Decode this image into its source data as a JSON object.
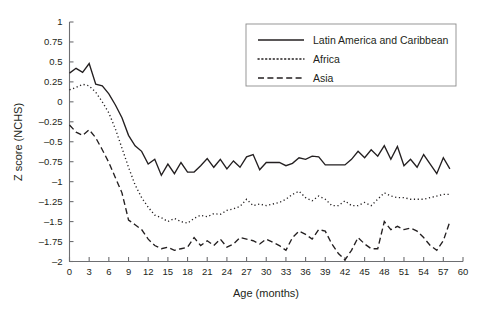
{
  "chart_data": {
    "type": "line",
    "title": "",
    "xlabel": "Age (months)",
    "ylabel": "Z score (NCHS)",
    "xlim": [
      0,
      60
    ],
    "ylim": [
      -2,
      1
    ],
    "xticks": [
      0,
      3,
      6,
      9,
      12,
      15,
      18,
      21,
      24,
      27,
      30,
      33,
      36,
      39,
      42,
      45,
      48,
      51,
      54,
      57,
      60
    ],
    "xtick_labels": [
      "0",
      "3",
      "6",
      "9",
      "12",
      "15",
      "18",
      "21",
      "24",
      "27",
      "30",
      "33",
      "36",
      "39",
      "42",
      "45",
      "48",
      "51",
      "54",
      "57",
      "60"
    ],
    "yticks": [
      1,
      0.75,
      0.5,
      0.25,
      0,
      -0.25,
      -0.5,
      -0.75,
      -1,
      -1.25,
      -1.5,
      -1.75,
      -2
    ],
    "ytick_labels": [
      "1",
      "0.75",
      "0.5",
      "0.25",
      "0",
      "–0.25",
      "–0.5",
      "–0.75",
      "–1",
      "–1.25",
      "–1.5",
      "–1.75",
      "–2"
    ],
    "grid": false,
    "legend_position": "top-right",
    "x": [
      0,
      1,
      2,
      3,
      4,
      5,
      6,
      7,
      8,
      9,
      10,
      11,
      12,
      13,
      14,
      15,
      16,
      17,
      18,
      19,
      20,
      21,
      22,
      23,
      24,
      25,
      26,
      27,
      28,
      29,
      30,
      31,
      32,
      33,
      34,
      35,
      36,
      37,
      38,
      39,
      40,
      41,
      42,
      43,
      44,
      45,
      46,
      47,
      48,
      49,
      50,
      51,
      52,
      53,
      54,
      55,
      56,
      57,
      58
    ],
    "series": [
      {
        "name": "Latin America and Caribbean",
        "style": "solid",
        "values": [
          0.36,
          0.42,
          0.37,
          0.48,
          0.22,
          0.2,
          0.1,
          -0.04,
          -0.2,
          -0.42,
          -0.55,
          -0.62,
          -0.78,
          -0.72,
          -0.92,
          -0.78,
          -0.9,
          -0.76,
          -0.88,
          -0.88,
          -0.8,
          -0.71,
          -0.82,
          -0.72,
          -0.84,
          -0.74,
          -0.82,
          -0.69,
          -0.66,
          -0.85,
          -0.76,
          -0.76,
          -0.76,
          -0.8,
          -0.77,
          -0.7,
          -0.72,
          -0.68,
          -0.69,
          -0.79,
          -0.79,
          -0.79,
          -0.79,
          -0.72,
          -0.62,
          -0.7,
          -0.6,
          -0.68,
          -0.55,
          -0.72,
          -0.56,
          -0.8,
          -0.72,
          -0.82,
          -0.66,
          -0.78,
          -0.9,
          -0.7,
          -0.84
        ]
      },
      {
        "name": "Africa",
        "style": "dotted",
        "values": [
          0.15,
          0.18,
          0.22,
          0.2,
          0.12,
          0.0,
          -0.14,
          -0.34,
          -0.58,
          -0.82,
          -1.04,
          -1.2,
          -1.32,
          -1.42,
          -1.45,
          -1.5,
          -1.46,
          -1.5,
          -1.52,
          -1.46,
          -1.42,
          -1.44,
          -1.4,
          -1.41,
          -1.36,
          -1.34,
          -1.31,
          -1.22,
          -1.3,
          -1.28,
          -1.3,
          -1.28,
          -1.26,
          -1.22,
          -1.16,
          -1.12,
          -1.2,
          -1.24,
          -1.18,
          -1.22,
          -1.3,
          -1.3,
          -1.24,
          -1.3,
          -1.3,
          -1.26,
          -1.3,
          -1.22,
          -1.14,
          -1.18,
          -1.2,
          -1.2,
          -1.22,
          -1.22,
          -1.22,
          -1.2,
          -1.18,
          -1.16,
          -1.16
        ]
      },
      {
        "name": "Asia",
        "style": "dashed",
        "values": [
          -0.29,
          -0.38,
          -0.42,
          -0.35,
          -0.45,
          -0.6,
          -0.76,
          -0.95,
          -1.14,
          -1.48,
          -1.54,
          -1.6,
          -1.72,
          -1.8,
          -1.84,
          -1.82,
          -1.86,
          -1.84,
          -1.82,
          -1.7,
          -1.8,
          -1.74,
          -1.8,
          -1.72,
          -1.82,
          -1.78,
          -1.7,
          -1.72,
          -1.74,
          -1.78,
          -1.72,
          -1.76,
          -1.8,
          -1.86,
          -1.7,
          -1.62,
          -1.66,
          -1.72,
          -1.6,
          -1.62,
          -1.78,
          -1.9,
          -1.98,
          -1.86,
          -1.7,
          -1.78,
          -1.84,
          -1.84,
          -1.5,
          -1.6,
          -1.56,
          -1.6,
          -1.58,
          -1.62,
          -1.7,
          -1.8,
          -1.86,
          -1.74,
          -1.5
        ]
      }
    ]
  },
  "legend": {
    "entries": [
      {
        "label": "Latin America and Caribbean",
        "style": "solid"
      },
      {
        "label": "Africa",
        "style": "dotted"
      },
      {
        "label": "Asia",
        "style": "dashed"
      }
    ]
  }
}
